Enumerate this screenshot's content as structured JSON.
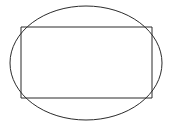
{
  "figure": {
    "canvas": {
      "width": 174,
      "height": 126,
      "background_color": "#ffffff"
    },
    "style": {
      "stroke_color": "#2b2b2b",
      "stroke_width": 1,
      "fill": "none"
    },
    "shapes": [
      {
        "name": "ellipse",
        "type": "ellipse",
        "center_x": 86,
        "center_y": 63,
        "radius_x": 76,
        "radius_y": 57,
        "bounds": {
          "left": 10,
          "top": 6,
          "right": 162,
          "bottom": 120
        },
        "stroke_color": "#2b2b2b",
        "stroke_width": 1,
        "fill": "none"
      },
      {
        "name": "rectangle",
        "type": "rect",
        "x": 21,
        "y": 27,
        "width": 131,
        "height": 71,
        "bounds": {
          "left": 21,
          "top": 27,
          "right": 152,
          "bottom": 98
        },
        "stroke_color": "#2b2b2b",
        "stroke_width": 1,
        "fill": "none",
        "relationship": "inscribed; all four corners touch the ellipse"
      }
    ],
    "corner_points": [
      {
        "name": "top-left",
        "x": 21,
        "y": 27
      },
      {
        "name": "top-right",
        "x": 152,
        "y": 27
      },
      {
        "name": "bottom-right",
        "x": 152,
        "y": 98
      },
      {
        "name": "bottom-left",
        "x": 21,
        "y": 98
      }
    ],
    "labels": []
  }
}
